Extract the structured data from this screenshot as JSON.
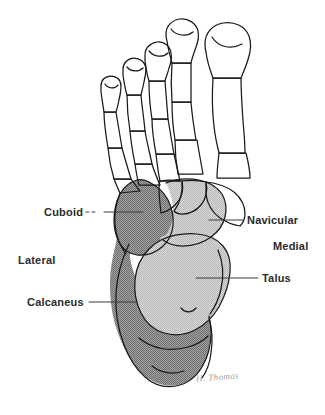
{
  "figure": {
    "view": "dorsal",
    "signature": "H. Thomas"
  },
  "labels": {
    "cuboid": "Cuboid",
    "lateral": "Lateral",
    "calcaneus": "Calcaneus",
    "navicular": "Navicular",
    "medial": "Medial",
    "talus": "Talus"
  },
  "colors": {
    "outline": "#1a1a1a",
    "background": "#ffffff",
    "bone_unshaded": "#ffffff",
    "shade_dark": "#8e8e8e",
    "shade_light": "#c9c9c9",
    "label_text": "#2b2b2b",
    "leader_line": "#3a3a3a",
    "signature": "#909090"
  },
  "regions": [
    {
      "name": "cuboid",
      "shade": "dark",
      "label": "Cuboid"
    },
    {
      "name": "calcaneus",
      "shade": "dark",
      "label": "Calcaneus"
    },
    {
      "name": "navicular",
      "shade": "light",
      "label": "Navicular"
    },
    {
      "name": "talus",
      "shade": "light",
      "label": "Talus"
    }
  ],
  "orientation": [
    {
      "name": "lateral",
      "label": "Lateral",
      "side": "left"
    },
    {
      "name": "medial",
      "label": "Medial",
      "side": "right"
    }
  ]
}
